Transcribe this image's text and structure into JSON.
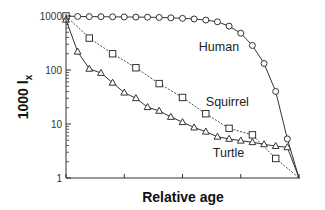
{
  "chart_data": {
    "type": "line",
    "title": "",
    "xlabel": "Relative age",
    "ylabel": "1000 l",
    "ylabel_subscript": "x",
    "yscale": "log",
    "ylim": [
      1,
      1000
    ],
    "xlim": [
      0,
      1
    ],
    "yticks": [
      1,
      10,
      100,
      1000
    ],
    "ytick_labels": [
      "1",
      "10",
      "100",
      "1000"
    ],
    "xticks": [
      0,
      0.25,
      0.5,
      0.75,
      1.0
    ],
    "xtick_labels": [
      "",
      "",
      "",
      "",
      ""
    ],
    "grid": false,
    "legend": "inline labels",
    "series": [
      {
        "name": "Human",
        "marker": "circle",
        "line_style": "solid",
        "label_pos": {
          "x": 0.57,
          "y": 270
        },
        "x": [
          0,
          0.05,
          0.1,
          0.15,
          0.2,
          0.25,
          0.3,
          0.35,
          0.4,
          0.45,
          0.5,
          0.55,
          0.6,
          0.65,
          0.7,
          0.75,
          0.8,
          0.85,
          0.9,
          0.95,
          1.0
        ],
        "values": [
          1000,
          980,
          975,
          970,
          965,
          960,
          955,
          950,
          940,
          925,
          905,
          880,
          840,
          780,
          650,
          480,
          285,
          132,
          40,
          5.3,
          1
        ]
      },
      {
        "name": "Squirrel",
        "marker": "square",
        "line_style": "dashed",
        "label_pos": {
          "x": 0.6,
          "y": 26
        },
        "x": [
          0,
          0.1,
          0.2,
          0.3,
          0.4,
          0.5,
          0.6,
          0.7,
          0.8,
          0.9,
          1.0
        ],
        "values": [
          1000,
          390,
          200,
          110,
          56,
          31,
          15.5,
          8.3,
          6.3,
          2.3,
          1
        ]
      },
      {
        "name": "Turtle",
        "marker": "triangle",
        "line_style": "solid",
        "label_pos": {
          "x": 0.63,
          "y": 2.9
        },
        "x": [
          0,
          0.05,
          0.1,
          0.15,
          0.2,
          0.25,
          0.3,
          0.35,
          0.4,
          0.45,
          0.5,
          0.55,
          0.6,
          0.65,
          0.7,
          0.75,
          0.8,
          0.85,
          0.9,
          0.95,
          1.0
        ],
        "values": [
          850,
          218,
          105,
          88,
          58,
          38,
          30,
          20.5,
          17.5,
          13.5,
          10.8,
          8.6,
          7.2,
          5.8,
          5.3,
          4.9,
          4.6,
          4.2,
          3.9,
          3.7,
          1
        ],
        "end_marker": false
      }
    ]
  }
}
